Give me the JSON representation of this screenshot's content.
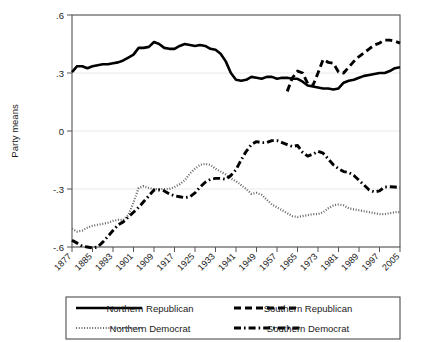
{
  "chart_data": {
    "type": "line",
    "title": "",
    "subtitle": "",
    "xlabel": "",
    "ylabel": "Party means",
    "xlim": [
      1877,
      2005
    ],
    "ylim": [
      -0.6,
      0.6
    ],
    "yticks": [
      0.6,
      0.3,
      0,
      -0.3,
      -0.6
    ],
    "ytick_labels": [
      ".6",
      ".3",
      "0",
      "-.3",
      "-.6"
    ],
    "xticks": [
      1877,
      1885,
      1893,
      1901,
      1909,
      1917,
      1925,
      1933,
      1941,
      1949,
      1957,
      1965,
      1973,
      1981,
      1989,
      1997,
      2005
    ],
    "xtick_labels": [
      "1877",
      "1885",
      "1893",
      "1901",
      "1909",
      "1917",
      "1925",
      "1933",
      "1941",
      "1949",
      "1957",
      "1965",
      "1973",
      "1981",
      "1989",
      "1997",
      "2005"
    ],
    "grid": true,
    "grid_axis": "y",
    "legend_position": "bottom",
    "legend_columns": 2,
    "series": [
      {
        "name": "Northern Republican",
        "style": "solid",
        "color": "#000000",
        "x": [
          1877,
          1879,
          1881,
          1883,
          1885,
          1887,
          1889,
          1891,
          1893,
          1895,
          1897,
          1899,
          1901,
          1903,
          1905,
          1907,
          1909,
          1911,
          1913,
          1915,
          1917,
          1919,
          1921,
          1923,
          1925,
          1927,
          1929,
          1931,
          1933,
          1935,
          1937,
          1939,
          1941,
          1943,
          1945,
          1947,
          1949,
          1951,
          1953,
          1955,
          1957,
          1959,
          1961,
          1963,
          1965,
          1967,
          1969,
          1971,
          1973,
          1975,
          1977,
          1979,
          1981,
          1983,
          1985,
          1987,
          1989,
          1991,
          1993,
          1995,
          1997,
          1999,
          2001,
          2003,
          2005
        ],
        "y": [
          0.305,
          0.335,
          0.335,
          0.325,
          0.335,
          0.34,
          0.345,
          0.345,
          0.35,
          0.355,
          0.365,
          0.38,
          0.395,
          0.43,
          0.43,
          0.435,
          0.46,
          0.45,
          0.43,
          0.425,
          0.425,
          0.44,
          0.45,
          0.445,
          0.44,
          0.445,
          0.44,
          0.425,
          0.42,
          0.4,
          0.36,
          0.3,
          0.265,
          0.26,
          0.265,
          0.28,
          0.275,
          0.27,
          0.28,
          0.28,
          0.27,
          0.275,
          0.275,
          0.27,
          0.27,
          0.255,
          0.235,
          0.23,
          0.225,
          0.22,
          0.22,
          0.215,
          0.22,
          0.25,
          0.26,
          0.265,
          0.275,
          0.285,
          0.29,
          0.295,
          0.3,
          0.3,
          0.31,
          0.325,
          0.33
        ]
      },
      {
        "name": "Southern Republican",
        "style": "dashed",
        "color": "#000000",
        "x": [
          1961,
          1963,
          1965,
          1967,
          1969,
          1971,
          1973,
          1975,
          1977,
          1979,
          1981,
          1983,
          1985,
          1987,
          1989,
          1991,
          1993,
          1995,
          1997,
          1999,
          2001,
          2003,
          2005
        ],
        "y": [
          0.205,
          0.275,
          0.31,
          0.3,
          0.245,
          0.235,
          0.3,
          0.37,
          0.355,
          0.35,
          0.305,
          0.3,
          0.33,
          0.36,
          0.385,
          0.405,
          0.425,
          0.445,
          0.455,
          0.47,
          0.47,
          0.465,
          0.455
        ]
      },
      {
        "name": "Northern Democrat",
        "style": "dotted",
        "color": "#666666",
        "x": [
          1877,
          1879,
          1881,
          1883,
          1885,
          1887,
          1889,
          1891,
          1893,
          1895,
          1897,
          1899,
          1901,
          1903,
          1905,
          1907,
          1909,
          1911,
          1913,
          1915,
          1917,
          1919,
          1921,
          1923,
          1925,
          1927,
          1929,
          1931,
          1933,
          1935,
          1937,
          1939,
          1941,
          1943,
          1945,
          1947,
          1949,
          1951,
          1953,
          1955,
          1957,
          1959,
          1961,
          1963,
          1965,
          1967,
          1969,
          1971,
          1973,
          1975,
          1977,
          1979,
          1981,
          1983,
          1985,
          1987,
          1989,
          1991,
          1993,
          1995,
          1997,
          1999,
          2001,
          2003,
          2005
        ],
        "y": [
          -0.505,
          -0.52,
          -0.515,
          -0.5,
          -0.49,
          -0.485,
          -0.48,
          -0.475,
          -0.465,
          -0.46,
          -0.46,
          -0.435,
          -0.37,
          -0.295,
          -0.285,
          -0.295,
          -0.3,
          -0.3,
          -0.3,
          -0.3,
          -0.29,
          -0.275,
          -0.255,
          -0.22,
          -0.195,
          -0.175,
          -0.17,
          -0.175,
          -0.195,
          -0.21,
          -0.225,
          -0.245,
          -0.26,
          -0.28,
          -0.3,
          -0.325,
          -0.32,
          -0.33,
          -0.355,
          -0.38,
          -0.395,
          -0.41,
          -0.425,
          -0.44,
          -0.445,
          -0.44,
          -0.435,
          -0.43,
          -0.43,
          -0.42,
          -0.4,
          -0.385,
          -0.38,
          -0.385,
          -0.4,
          -0.405,
          -0.41,
          -0.415,
          -0.42,
          -0.425,
          -0.43,
          -0.43,
          -0.425,
          -0.42,
          -0.42
        ]
      },
      {
        "name": "Southern Democrat",
        "style": "dash-dot",
        "color": "#000000",
        "x": [
          1877,
          1879,
          1881,
          1883,
          1885,
          1887,
          1889,
          1891,
          1893,
          1895,
          1897,
          1899,
          1901,
          1903,
          1905,
          1907,
          1909,
          1911,
          1913,
          1915,
          1917,
          1919,
          1921,
          1923,
          1925,
          1927,
          1929,
          1931,
          1933,
          1935,
          1937,
          1939,
          1941,
          1943,
          1945,
          1947,
          1949,
          1951,
          1953,
          1955,
          1957,
          1959,
          1961,
          1963,
          1965,
          1967,
          1969,
          1971,
          1973,
          1975,
          1977,
          1979,
          1981,
          1983,
          1985,
          1987,
          1989,
          1991,
          1993,
          1995,
          1997,
          1999,
          2001,
          2003,
          2005
        ],
        "y": [
          -0.565,
          -0.58,
          -0.595,
          -0.6,
          -0.605,
          -0.6,
          -0.575,
          -0.545,
          -0.515,
          -0.485,
          -0.47,
          -0.445,
          -0.42,
          -0.395,
          -0.365,
          -0.335,
          -0.305,
          -0.305,
          -0.31,
          -0.325,
          -0.335,
          -0.34,
          -0.345,
          -0.34,
          -0.32,
          -0.29,
          -0.265,
          -0.25,
          -0.245,
          -0.245,
          -0.25,
          -0.23,
          -0.2,
          -0.15,
          -0.105,
          -0.07,
          -0.055,
          -0.06,
          -0.06,
          -0.05,
          -0.05,
          -0.06,
          -0.07,
          -0.08,
          -0.075,
          -0.11,
          -0.13,
          -0.12,
          -0.105,
          -0.115,
          -0.145,
          -0.175,
          -0.195,
          -0.21,
          -0.215,
          -0.23,
          -0.255,
          -0.28,
          -0.305,
          -0.315,
          -0.31,
          -0.29,
          -0.288,
          -0.29,
          -0.292
        ]
      }
    ]
  },
  "legend": {
    "entries": [
      {
        "label": "Northern Republican",
        "style": "solid"
      },
      {
        "label": "Southern Republican",
        "style": "dashed"
      },
      {
        "label": "Northern Democrat",
        "style": "dotted"
      },
      {
        "label": "Southern Democrat",
        "style": "dash-dot"
      }
    ]
  },
  "colors": {
    "line": "#000000",
    "dotted_line": "#666666",
    "grid": "#e9e9e9",
    "frame": "#555555",
    "background": "#ffffff"
  }
}
